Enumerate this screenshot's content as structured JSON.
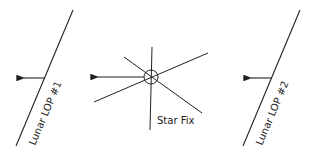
{
  "diagram": {
    "labels": {
      "lop1": "Lunar LOP #1",
      "lop2": "Lunar LOP #2",
      "star_fix": "Star Fix"
    },
    "colors": {
      "line": "#222222",
      "background": "#ffffff"
    }
  }
}
